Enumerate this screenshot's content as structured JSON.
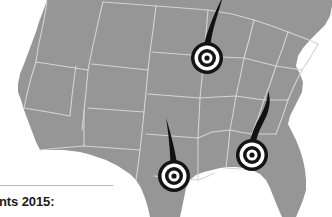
{
  "canvas": {
    "width": 332,
    "height": 217,
    "background": "#ffffff"
  },
  "map": {
    "region_name": "United States",
    "fill_color": "#969696",
    "border_color": "#d4d4d4",
    "projection_note": "contiguous united states, cropped at bottom"
  },
  "markers": [
    {
      "id": "marker-1",
      "label": "",
      "icon": "bullseye-target-marker",
      "x": 207,
      "y": 58,
      "radius": 16,
      "tail": "up-right",
      "color_dark": "#111111",
      "color_light": "#ffffff"
    },
    {
      "id": "marker-2",
      "label": "",
      "icon": "bullseye-target-marker",
      "x": 174,
      "y": 176,
      "radius": 16,
      "tail": "up",
      "color_dark": "#111111",
      "color_light": "#ffffff"
    },
    {
      "id": "marker-3",
      "label": "",
      "icon": "bullseye-target-marker",
      "x": 252,
      "y": 155,
      "radius": 16,
      "tail": "up-right-curved",
      "color_dark": "#111111",
      "color_light": "#ffffff"
    }
  ],
  "caption": {
    "text": "nts 2015:",
    "divider_color": "#b9b9b9",
    "text_color": "#1b1b1b"
  }
}
